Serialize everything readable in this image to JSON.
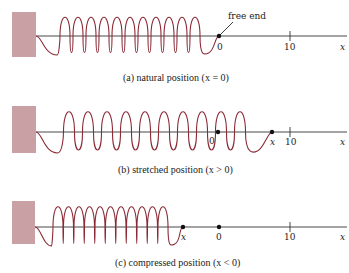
{
  "colors": {
    "wall": "#c9a1a5",
    "coil": "#8b2a35",
    "axis": "#333333",
    "dot": "#111111",
    "text": "#222222"
  },
  "panels": [
    {
      "id": "a",
      "caption": "(a)   natural position (x = 0)",
      "annotation": "free end",
      "end_label": "0",
      "tick_label": "10",
      "axis_label": "x",
      "loops": 11
    },
    {
      "id": "b",
      "caption": "(b)   stretched position (x > 0)",
      "origin_label": "0",
      "end_label": "x",
      "tick_label": "10",
      "axis_label": "x",
      "loops": 10
    },
    {
      "id": "c",
      "caption": "(c)   compressed position (x < 0)",
      "origin_label": "0",
      "end_label": "x",
      "tick_label": "10",
      "axis_label": "x",
      "loops": 11
    }
  ]
}
